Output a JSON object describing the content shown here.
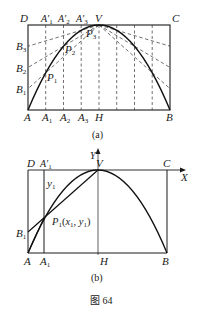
{
  "figure": {
    "caption": "图 64",
    "panel_a": {
      "label": "(a)",
      "corners": {
        "D": "D",
        "C": "C",
        "A": "A",
        "B": "B",
        "V": "V",
        "H": "H"
      },
      "top_points": [
        "A'1",
        "A'2",
        "A'3"
      ],
      "bottom_points": [
        "A1",
        "A2",
        "A3"
      ],
      "left_points": [
        "B1",
        "B2",
        "B3"
      ],
      "curve_points": [
        "P1",
        "P2",
        "P3"
      ]
    },
    "panel_b": {
      "label": "(b)",
      "corners": {
        "D": "D",
        "C": "C",
        "A": "A",
        "B": "B",
        "V": "V",
        "H": "H"
      },
      "top_point": "A'1",
      "bottom_point": "A1",
      "left_point": "B1",
      "curve_point": "P1(x1, y1)",
      "segment_label": "y1",
      "axis_x": "X",
      "axis_y": "Y"
    }
  }
}
